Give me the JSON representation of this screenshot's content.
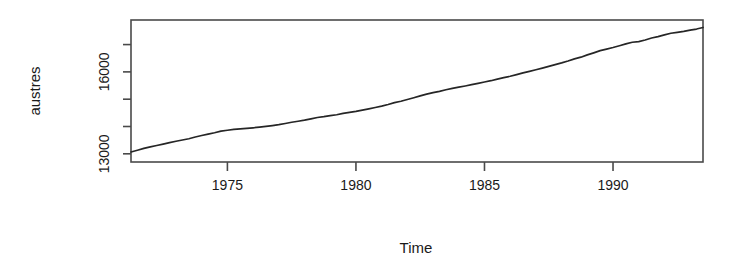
{
  "chart_data": {
    "type": "line",
    "title": "",
    "xlabel": "Time",
    "ylabel": "austres",
    "xlim": [
      1971.25,
      1993.5
    ],
    "ylim": [
      12700,
      17900
    ],
    "grid": false,
    "legend": null,
    "x_ticks": [
      1975,
      1980,
      1985,
      1990
    ],
    "x_tick_labels": [
      "1975",
      "1980",
      "1985",
      "1990"
    ],
    "y_ticks": [
      13000,
      14000,
      15000,
      16000,
      17000
    ],
    "y_tick_labels": [
      "13000",
      "",
      "",
      "16000",
      ""
    ],
    "y_labeled_ticks": [
      {
        "value": 16000,
        "label": "16000"
      },
      {
        "value": 13000,
        "label": "13000"
      }
    ],
    "series": [
      {
        "name": "austres",
        "units": "thousands of persons",
        "x": [
          1971.25,
          1971.5,
          1971.75,
          1972.0,
          1972.25,
          1972.5,
          1972.75,
          1973.0,
          1973.25,
          1973.5,
          1973.75,
          1974.0,
          1974.25,
          1974.5,
          1974.75,
          1975.0,
          1975.25,
          1975.5,
          1975.75,
          1976.0,
          1976.25,
          1976.5,
          1976.75,
          1977.0,
          1977.25,
          1977.5,
          1977.75,
          1978.0,
          1978.25,
          1978.5,
          1978.75,
          1979.0,
          1979.25,
          1979.5,
          1979.75,
          1980.0,
          1980.25,
          1980.5,
          1980.75,
          1981.0,
          1981.25,
          1981.5,
          1981.75,
          1982.0,
          1982.25,
          1982.5,
          1982.75,
          1983.0,
          1983.25,
          1983.5,
          1983.75,
          1984.0,
          1984.25,
          1984.5,
          1984.75,
          1985.0,
          1985.25,
          1985.5,
          1985.75,
          1986.0,
          1986.25,
          1986.5,
          1986.75,
          1987.0,
          1987.25,
          1987.5,
          1987.75,
          1988.0,
          1988.25,
          1988.5,
          1988.75,
          1989.0,
          1989.25,
          1989.5,
          1989.75,
          1990.0,
          1990.25,
          1990.5,
          1990.75,
          1991.0,
          1991.25,
          1991.5,
          1991.75,
          1992.0,
          1992.25,
          1992.5,
          1992.75,
          1993.0,
          1993.25,
          1993.5
        ],
        "values": [
          13067.3,
          13130.5,
          13198.4,
          13254.2,
          13303.7,
          13353.9,
          13409.3,
          13459.2,
          13504.5,
          13552.6,
          13614.3,
          13669.5,
          13722.6,
          13772.1,
          13832.0,
          13862.6,
          13893.0,
          13914.0,
          13932.0,
          13953.0,
          13977.0,
          14004.0,
          14033.0,
          14066.0,
          14110.0,
          14155.6,
          14192.2,
          14231.7,
          14281.5,
          14330.3,
          14359.3,
          14396.6,
          14430.8,
          14478.4,
          14515.7,
          14554.9,
          14602.5,
          14646.4,
          14695.4,
          14746.6,
          14807.4,
          14874.4,
          14923.3,
          14988.7,
          15054.1,
          15121.7,
          15184.2,
          15239.3,
          15288.9,
          15346.2,
          15393.5,
          15439.0,
          15483.5,
          15531.5,
          15579.4,
          15628.5,
          15677.3,
          15736.7,
          15788.3,
          15839.7,
          15900.6,
          15961.5,
          16018.3,
          16076.9,
          16139.0,
          16203.0,
          16263.3,
          16327.9,
          16398.9,
          16478.3,
          16538.2,
          16621.6,
          16697.0,
          16777.2,
          16833.1,
          16891.6,
          16956.8,
          17026.3,
          17085.4,
          17106.9,
          17169.4,
          17239.4,
          17292.0,
          17354.2,
          17414.2,
          17447.3,
          17482.6,
          17526.0,
          17568.7,
          17627.1
        ]
      }
    ]
  },
  "axes": {
    "y_axis_title": "austres",
    "x_axis_title": "Time"
  },
  "style": {
    "line_color": "#262626",
    "axis_color": "#4a4a4a",
    "background": "#ffffff",
    "text_color": "#1a1a1a"
  }
}
